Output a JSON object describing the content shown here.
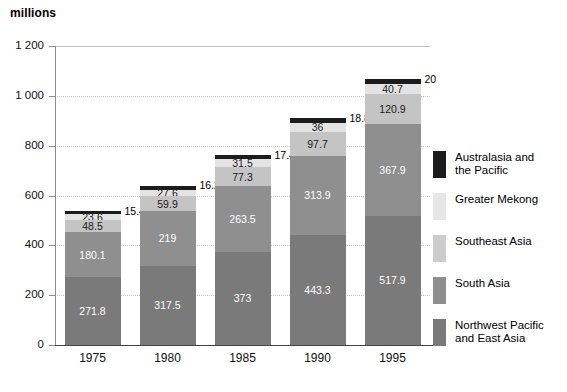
{
  "chart_data": {
    "type": "bar",
    "stacked": true,
    "title": "",
    "ylabel": "millions",
    "xlabel": "",
    "ylim": [
      0,
      1200
    ],
    "yticks": [
      0,
      200,
      400,
      600,
      800,
      1000,
      1200
    ],
    "ytick_labels": [
      "0",
      "200",
      "400",
      "600",
      "800",
      "1 000",
      "1 200"
    ],
    "grid": true,
    "legend_position": "right",
    "categories": [
      "1975",
      "1980",
      "1985",
      "1990",
      "1995"
    ],
    "series": [
      {
        "name": "Northwest Pacific and East Asia",
        "color": "#7a7a7a",
        "values": [
          271.8,
          317.5,
          373,
          443.3,
          517.9
        ],
        "labels": [
          "271.8",
          "317.5",
          "373",
          "443.3",
          "517.9"
        ]
      },
      {
        "name": "South Asia",
        "color": "#8f8f8f",
        "values": [
          180.1,
          219,
          263.5,
          313.9,
          367.9
        ],
        "labels": [
          "180.1",
          "219",
          "263.5",
          "313.9",
          "367.9"
        ]
      },
      {
        "name": "Southeast Asia",
        "color": "#c4c4c4",
        "values": [
          48.5,
          59.9,
          77.3,
          97.7,
          120.9
        ],
        "labels": [
          "48.5",
          "59.9",
          "77.3",
          "97.7",
          "120.9"
        ]
      },
      {
        "name": "Greater Mekong",
        "color": "#e3e3e3",
        "values": [
          23.6,
          27.6,
          31.5,
          36,
          40.7
        ],
        "labels": [
          "23.6",
          "27.6",
          "31.5",
          "36",
          "40.7"
        ]
      },
      {
        "name": "Australasia and the Pacific",
        "color": "#1c1c1c",
        "values": [
          15.4,
          16.2,
          17.4,
          18.8,
          20
        ],
        "labels": [
          "15.4",
          "16.2",
          "17.4",
          "18.8",
          "20"
        ],
        "labels_outside": true
      }
    ],
    "totals": [
      539.4,
      640.2,
      762.7,
      909.7,
      1067.4
    ]
  },
  "legend": {
    "items": [
      {
        "label_line1": "Australasia and",
        "label_line2": "the Pacific",
        "swatch": "sw-ap"
      },
      {
        "label_line1": "Greater Mekong",
        "label_line2": "",
        "swatch": "sw-gm"
      },
      {
        "label_line1": "Southeast Asia",
        "label_line2": "",
        "swatch": "sw-sea"
      },
      {
        "label_line1": "South Asia",
        "label_line2": "",
        "swatch": "sw-sa"
      },
      {
        "label_line1": "Northwest Pacific",
        "label_line2": "and East Asia",
        "swatch": "sw-nwp"
      }
    ]
  }
}
